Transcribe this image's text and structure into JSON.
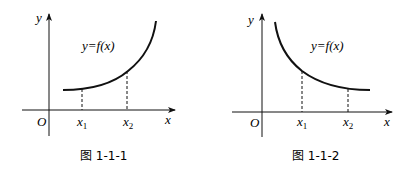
{
  "figures": [
    {
      "id": "fig-1-1-1",
      "caption": "图 1-1-1",
      "function_label": "y=f(x)",
      "y_axis_label": "y",
      "x_axis_label": "x",
      "origin_label": "O",
      "x1_label": "x",
      "x1_sub": "1",
      "x2_label": "x",
      "x2_sub": "2",
      "trend": "increasing"
    },
    {
      "id": "fig-1-1-2",
      "caption": "图 1-1-2",
      "function_label": "y=f(x)",
      "y_axis_label": "y",
      "x_axis_label": "x",
      "origin_label": "O",
      "x1_label": "x",
      "x1_sub": "1",
      "x2_label": "x",
      "x2_sub": "2",
      "trend": "decreasing"
    }
  ]
}
